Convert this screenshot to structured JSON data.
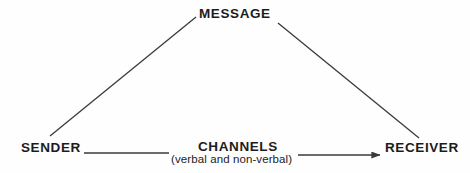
{
  "diagram": {
    "background_color": "#fefefe",
    "line_color": "#3a3a3a",
    "text_color": "#1c1c1c",
    "nodes": {
      "message": "MESSAGE",
      "sender": "SENDER",
      "receiver": "RECEIVER",
      "channels": "CHANNELS",
      "channels_sub": "(verbal and non-verbal)"
    },
    "connectors": {
      "sender_to_message": "diagonal-line-sender-message",
      "message_to_receiver": "diagonal-line-message-receiver",
      "sender_to_channels": "horizontal-line-sender-channels",
      "channels_to_receiver": "arrow-channels-receiver"
    }
  }
}
